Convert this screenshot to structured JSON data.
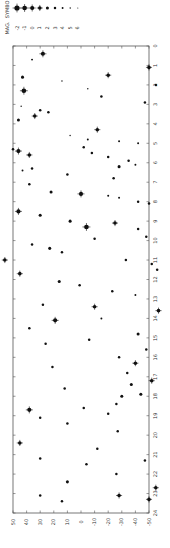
{
  "chart_data": {
    "type": "scatter",
    "title": "",
    "orientation": "rotated-90-ccw",
    "xlabel": "Right Ascension (hours)",
    "ylabel": "Declination (degrees)",
    "x_axis": {
      "ticks": [
        0,
        1,
        2,
        3,
        4,
        5,
        6,
        7,
        8,
        9,
        10,
        11,
        12,
        13,
        14,
        15,
        16,
        17,
        18,
        19,
        20,
        21,
        22,
        23,
        24
      ],
      "range": [
        0,
        24
      ]
    },
    "y_axis": {
      "ticks": [
        50,
        40,
        30,
        20,
        10,
        0,
        -10,
        -20,
        -30,
        -40,
        -50
      ],
      "range": [
        50,
        -50
      ]
    },
    "grid": false,
    "legend": {
      "position": "top-left",
      "mag_label": "MAG.",
      "symbol_label": "SYMBOL",
      "entries": [
        -2,
        -1,
        0,
        1,
        2,
        3,
        4,
        5,
        6
      ]
    },
    "points": [
      {
        "ra": 0.4,
        "dec": 28,
        "mag": 0
      },
      {
        "ra": 0.7,
        "dec": 36,
        "mag": 4
      },
      {
        "ra": 1.1,
        "dec": -50,
        "mag": 1
      },
      {
        "ra": 1.5,
        "dec": -20,
        "mag": 1
      },
      {
        "ra": 1.6,
        "dec": 43,
        "mag": 2
      },
      {
        "ra": 1.8,
        "dec": 14,
        "mag": 5
      },
      {
        "ra": 2.0,
        "dec": -55,
        "mag": 3
      },
      {
        "ra": 2.3,
        "dec": 42,
        "mag": -1
      },
      {
        "ra": 2.2,
        "dec": -5,
        "mag": 5
      },
      {
        "ra": 2.6,
        "dec": -15,
        "mag": 3
      },
      {
        "ra": 2.9,
        "dec": -47,
        "mag": 3
      },
      {
        "ra": 3.1,
        "dec": 44,
        "mag": 5
      },
      {
        "ra": 3.4,
        "dec": 24,
        "mag": 3
      },
      {
        "ra": 3.3,
        "dec": 30,
        "mag": 3
      },
      {
        "ra": 3.6,
        "dec": 34,
        "mag": 1
      },
      {
        "ra": 3.8,
        "dec": 46,
        "mag": 2
      },
      {
        "ra": 4.3,
        "dec": -12,
        "mag": 1
      },
      {
        "ra": 4.6,
        "dec": 8,
        "mag": 5
      },
      {
        "ra": 4.8,
        "dec": -5,
        "mag": 4
      },
      {
        "ra": 5.0,
        "dec": -42,
        "mag": 4
      },
      {
        "ra": 4.9,
        "dec": -28,
        "mag": 4
      },
      {
        "ra": 5.3,
        "dec": 50,
        "mag": 3
      },
      {
        "ra": 5.4,
        "dec": 46,
        "mag": 0
      },
      {
        "ra": 5.2,
        "dec": -2,
        "mag": 3
      },
      {
        "ra": 5.6,
        "dec": 38,
        "mag": 1
      },
      {
        "ra": 5.5,
        "dec": -8,
        "mag": 3
      },
      {
        "ra": 5.7,
        "dec": -20,
        "mag": 3
      },
      {
        "ra": 5.9,
        "dec": -35,
        "mag": 3
      },
      {
        "ra": 6.1,
        "dec": -40,
        "mag": 4
      },
      {
        "ra": 6.2,
        "dec": -28,
        "mag": 2
      },
      {
        "ra": 6.3,
        "dec": 36,
        "mag": 3
      },
      {
        "ra": 6.4,
        "dec": 43,
        "mag": 4
      },
      {
        "ra": 6.6,
        "dec": 10,
        "mag": 3
      },
      {
        "ra": 6.8,
        "dec": -24,
        "mag": 3
      },
      {
        "ra": 7.1,
        "dec": 38,
        "mag": 3
      },
      {
        "ra": 7.5,
        "dec": 22,
        "mag": 2
      },
      {
        "ra": 7.6,
        "dec": 0,
        "mag": 0
      },
      {
        "ra": 7.7,
        "dec": -20,
        "mag": 4
      },
      {
        "ra": 7.8,
        "dec": -28,
        "mag": 4
      },
      {
        "ra": 8.0,
        "dec": -42,
        "mag": 3
      },
      {
        "ra": 8.1,
        "dec": -50,
        "mag": 3
      },
      {
        "ra": 8.5,
        "dec": 46,
        "mag": 0
      },
      {
        "ra": 8.7,
        "dec": 30,
        "mag": 2
      },
      {
        "ra": 9.0,
        "dec": 8,
        "mag": 2
      },
      {
        "ra": 9.1,
        "dec": -25,
        "mag": 1
      },
      {
        "ra": 9.3,
        "dec": -4,
        "mag": -1
      },
      {
        "ra": 9.4,
        "dec": -42,
        "mag": 3
      },
      {
        "ra": 9.8,
        "dec": -48,
        "mag": 3
      },
      {
        "ra": 9.9,
        "dec": -10,
        "mag": 3
      },
      {
        "ra": 10.2,
        "dec": 36,
        "mag": 3
      },
      {
        "ra": 10.4,
        "dec": 23,
        "mag": 2
      },
      {
        "ra": 10.6,
        "dec": 14,
        "mag": 3
      },
      {
        "ra": 11.0,
        "dec": -33,
        "mag": 3
      },
      {
        "ra": 11.2,
        "dec": -52,
        "mag": 3
      },
      {
        "ra": 11.5,
        "dec": -56,
        "mag": 3
      },
      {
        "ra": 11.0,
        "dec": 56,
        "mag": 1
      },
      {
        "ra": 11.7,
        "dec": 45,
        "mag": 1
      },
      {
        "ra": 12.1,
        "dec": 16,
        "mag": 2
      },
      {
        "ra": 12.3,
        "dec": 1,
        "mag": 3
      },
      {
        "ra": 12.6,
        "dec": -23,
        "mag": 3
      },
      {
        "ra": 12.8,
        "dec": -40,
        "mag": 4
      },
      {
        "ra": 13.3,
        "dec": 28,
        "mag": 3
      },
      {
        "ra": 13.4,
        "dec": -10,
        "mag": 1
      },
      {
        "ra": 13.6,
        "dec": -57,
        "mag": 1
      },
      {
        "ra": 14.0,
        "dec": -15,
        "mag": 4
      },
      {
        "ra": 14.1,
        "dec": 19,
        "mag": 0
      },
      {
        "ra": 14.5,
        "dec": 38,
        "mag": 3
      },
      {
        "ra": 14.8,
        "dec": -42,
        "mag": 2
      },
      {
        "ra": 15.1,
        "dec": -6,
        "mag": 3
      },
      {
        "ra": 15.3,
        "dec": 26,
        "mag": 3
      },
      {
        "ra": 15.6,
        "dec": -48,
        "mag": 3
      },
      {
        "ra": 16.0,
        "dec": -28,
        "mag": 3
      },
      {
        "ra": 16.3,
        "dec": -40,
        "mag": 1
      },
      {
        "ra": 16.5,
        "dec": 21,
        "mag": 3
      },
      {
        "ra": 16.8,
        "dec": -34,
        "mag": 3
      },
      {
        "ra": 17.2,
        "dec": -52,
        "mag": 1
      },
      {
        "ra": 17.4,
        "dec": -37,
        "mag": 2
      },
      {
        "ra": 17.6,
        "dec": 12,
        "mag": 3
      },
      {
        "ra": 17.9,
        "dec": -44,
        "mag": 2
      },
      {
        "ra": 18.0,
        "dec": -30,
        "mag": 2
      },
      {
        "ra": 18.4,
        "dec": -26,
        "mag": 3
      },
      {
        "ra": 18.6,
        "dec": -2,
        "mag": 3
      },
      {
        "ra": 18.7,
        "dec": 38,
        "mag": 0
      },
      {
        "ra": 18.9,
        "dec": -20,
        "mag": 3
      },
      {
        "ra": 19.1,
        "dec": 30,
        "mag": 3
      },
      {
        "ra": 19.4,
        "dec": 10,
        "mag": 3
      },
      {
        "ra": 19.8,
        "dec": -27,
        "mag": 3
      },
      {
        "ra": 20.4,
        "dec": 45,
        "mag": 1
      },
      {
        "ra": 20.7,
        "dec": -12,
        "mag": 3
      },
      {
        "ra": 21.2,
        "dec": 30,
        "mag": 3
      },
      {
        "ra": 21.5,
        "dec": -4,
        "mag": 3
      },
      {
        "ra": 21.3,
        "dec": -47,
        "mag": 3
      },
      {
        "ra": 22.0,
        "dec": -26,
        "mag": 3
      },
      {
        "ra": 22.4,
        "dec": 10,
        "mag": 2
      },
      {
        "ra": 22.7,
        "dec": -55,
        "mag": 1
      },
      {
        "ra": 23.1,
        "dec": 30,
        "mag": 3
      },
      {
        "ra": 23.1,
        "dec": -28,
        "mag": 1
      },
      {
        "ra": 23.4,
        "dec": 14,
        "mag": 3
      },
      {
        "ra": 23.3,
        "dec": -50,
        "mag": 1
      }
    ]
  }
}
